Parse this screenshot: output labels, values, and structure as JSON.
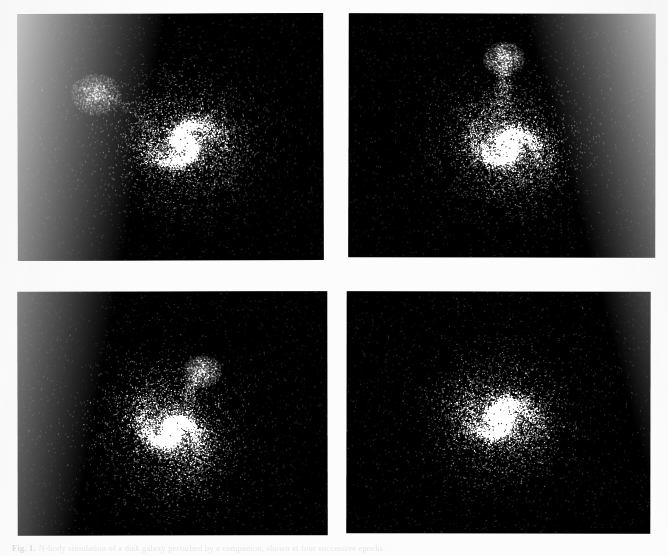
{
  "figure": {
    "background_color": "#fcfcfc",
    "panel_background_color": "#000000",
    "star_color": "#ffffff",
    "caption_label": "Fig. 1.",
    "caption_text": "N-body simulation of a disk galaxy perturbed by a companion, shown at four successive epochs.",
    "panels": [
      {
        "id": "panel-1",
        "name": "top-left",
        "primary": "spiral disk galaxy",
        "companion": "diffuse elliptical companion, upper left",
        "arms": 2,
        "description": "Two-armed spiral with bright nucleus; companion separated to the upper left, no bridge yet."
      },
      {
        "id": "panel-2",
        "name": "top-right",
        "primary": "spiral disk galaxy",
        "companion": "compact companion directly above, linked by a tidal bridge",
        "arms": 2,
        "description": "Companion above the disk; a narrow tidal bridge of particles connects it to the spiral."
      },
      {
        "id": "panel-3",
        "name": "bottom-left",
        "primary": "spiral disk galaxy",
        "companion": "companion to the upper right, drawn into an outer arm",
        "arms": 2,
        "description": "Companion to the upper right; an outer arm sweeps up toward it."
      },
      {
        "id": "panel-4",
        "name": "bottom-right",
        "primary": "spiral disk galaxy",
        "companion": "none visible (merged / stripped)",
        "arms": 2,
        "description": "Relaxed two-armed spiral, no distinct companion remaining."
      }
    ]
  },
  "simulation": {
    "particles_per_panel": 9000,
    "halo_particles_per_panel": 2600,
    "disk_scale_radius_fraction": 0.115,
    "spiral_pitch": 0.55,
    "panel_params": [
      {
        "id": "panel-1",
        "cx": 0.545,
        "cy": 0.525,
        "disk_r": 0.125,
        "halo_r": 0.3,
        "rotation_deg": -18,
        "arm_strength": 0.82,
        "arm_turns": 1.05,
        "core_brightness": 1.0,
        "companion": {
          "cx": 0.255,
          "cy": 0.325,
          "r": 0.042,
          "n": 950,
          "brightness": 0.62
        },
        "bridge": null,
        "tail": {
          "from": [
            0.3,
            0.33
          ],
          "to": [
            0.46,
            0.47
          ],
          "n": 160,
          "width": 0.018
        }
      },
      {
        "id": "panel-2",
        "cx": 0.515,
        "cy": 0.545,
        "disk_r": 0.118,
        "halo_r": 0.31,
        "rotation_deg": 8,
        "arm_strength": 0.78,
        "arm_turns": 1.0,
        "core_brightness": 1.0,
        "companion": {
          "cx": 0.505,
          "cy": 0.185,
          "r": 0.035,
          "n": 820,
          "brightness": 0.7
        },
        "bridge": {
          "from": [
            0.505,
            0.22
          ],
          "to": [
            0.5,
            0.45
          ],
          "n": 520,
          "width": 0.028
        },
        "tail": null
      },
      {
        "id": "panel-3",
        "cx": 0.495,
        "cy": 0.575,
        "disk_r": 0.128,
        "halo_r": 0.32,
        "rotation_deg": 34,
        "arm_strength": 0.8,
        "arm_turns": 1.08,
        "core_brightness": 1.0,
        "companion": {
          "cx": 0.595,
          "cy": 0.325,
          "r": 0.033,
          "n": 760,
          "brightness": 0.66
        },
        "bridge": {
          "from": [
            0.575,
            0.36
          ],
          "to": [
            0.525,
            0.49
          ],
          "n": 300,
          "width": 0.026
        },
        "tail": null
      },
      {
        "id": "panel-4",
        "cx": 0.505,
        "cy": 0.525,
        "disk_r": 0.12,
        "halo_r": 0.335,
        "rotation_deg": -5,
        "arm_strength": 0.7,
        "arm_turns": 1.15,
        "core_brightness": 1.0,
        "companion": null,
        "bridge": null,
        "tail": null
      }
    ]
  }
}
